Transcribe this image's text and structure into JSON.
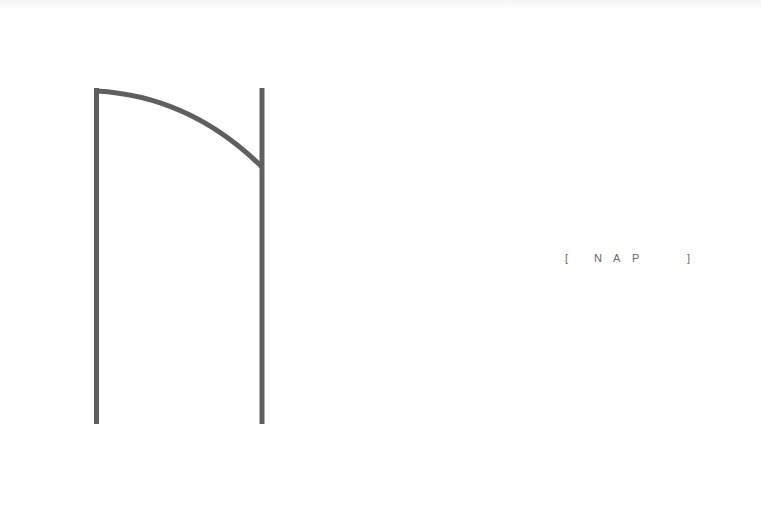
{
  "logo": {
    "name": "nap-logo-mark",
    "stroke_color": "#5f5f5f"
  },
  "caption": {
    "open_bracket": "[",
    "letters": [
      "N",
      "A",
      "P"
    ],
    "close_bracket": "]",
    "color": "#6a6a6a"
  }
}
